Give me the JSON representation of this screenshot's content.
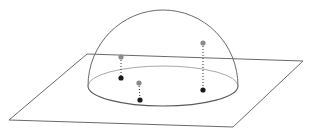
{
  "diagram": {
    "colors": {
      "background": "#ffffff",
      "plane_stroke": "#6a6a6a",
      "dome_stroke": "#6a6a6a",
      "base_back_stroke": "#a8a8a8",
      "base_front_stroke": "#5a5a5a",
      "upper_point": "#8a8a8a",
      "projected_point": "#1a1a1a",
      "dotted_line": "#2a2a2a"
    },
    "plane": {
      "corners": [
        [
          87,
          54
        ],
        [
          303,
          61
        ],
        [
          233,
          127
        ],
        [
          9,
          120
        ]
      ]
    },
    "hemisphere": {
      "center": [
        163,
        86
      ],
      "rx": 75,
      "ry": 20,
      "top_y": 10
    },
    "points": [
      {
        "id": "p1",
        "upper": [
          121,
          57
        ],
        "projected": [
          121,
          78
        ]
      },
      {
        "id": "p2",
        "upper": [
          139,
          83
        ],
        "projected": [
          140,
          100
        ]
      },
      {
        "id": "p3",
        "upper": [
          203,
          43
        ],
        "projected": [
          203,
          90
        ]
      }
    ]
  }
}
